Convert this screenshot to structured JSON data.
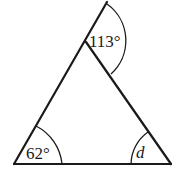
{
  "diagram": {
    "type": "triangle-angles",
    "colors": {
      "stroke": "#1a1a1a",
      "background": "#ffffff"
    },
    "vertices": {
      "bottom_left": [
        14,
        164
      ],
      "bottom_right": [
        171,
        164
      ],
      "apex": [
        86,
        42
      ],
      "extension_end": [
        107,
        2
      ]
    },
    "angles": [
      {
        "id": "exterior-apex",
        "label": "113°",
        "kind": "exterior"
      },
      {
        "id": "bottom-left",
        "label": "62°",
        "kind": "interior"
      },
      {
        "id": "bottom-right",
        "label": "d",
        "kind": "interior-unknown"
      }
    ]
  }
}
